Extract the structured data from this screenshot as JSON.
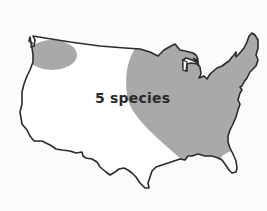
{
  "map": {
    "region": "Contiguous United States",
    "label": "5 species",
    "colors": {
      "background": "#fbfbfa",
      "range_fill": "#a9a9a9",
      "outline": "#2b2b2b",
      "land": "#ffffff",
      "label": "#2a2a2a"
    },
    "shaded_ranges": [
      {
        "name": "pacific-northwest-range"
      },
      {
        "name": "eastern-range"
      }
    ]
  }
}
